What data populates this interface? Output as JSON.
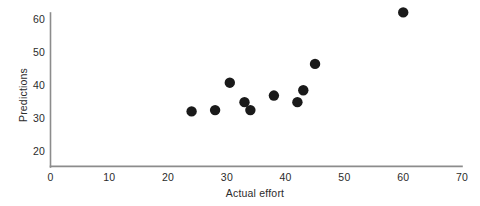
{
  "chart_data": {
    "type": "scatter",
    "title": "",
    "xlabel": "Actual effort",
    "ylabel": "Predictions",
    "xlim": [
      0,
      70
    ],
    "ylim": [
      20,
      63
    ],
    "xticks": [
      0,
      10,
      20,
      30,
      40,
      50,
      60,
      70
    ],
    "yticks": [
      20,
      30,
      40,
      50,
      60
    ],
    "xtick_labels": [
      "0",
      "10",
      "20",
      "30",
      "40",
      "50",
      "60",
      "70"
    ],
    "ytick_labels": [
      "20",
      "30",
      "40",
      "50",
      "60"
    ],
    "grid": false,
    "legend": null,
    "series": [
      {
        "name": "Predictions vs actual effort",
        "marker": "circle",
        "marker_color": "#1a1a1a",
        "marker_size": 5.2,
        "points": [
          {
            "x": 24.0,
            "y": 32.0
          },
          {
            "x": 28.0,
            "y": 32.4
          },
          {
            "x": 30.5,
            "y": 40.7
          },
          {
            "x": 33.0,
            "y": 34.8
          },
          {
            "x": 34.0,
            "y": 32.4
          },
          {
            "x": 38.0,
            "y": 36.8
          },
          {
            "x": 42.0,
            "y": 34.8
          },
          {
            "x": 43.0,
            "y": 38.4
          },
          {
            "x": 45.0,
            "y": 46.4
          },
          {
            "x": 60.0,
            "y": 62.0
          }
        ]
      }
    ],
    "axis_color": "#8c8c8c",
    "text_color": "#2b2b2b",
    "background": "#ffffff"
  },
  "axes": {
    "x_axis_name": "x-axis",
    "y_axis_name": "y-axis"
  }
}
